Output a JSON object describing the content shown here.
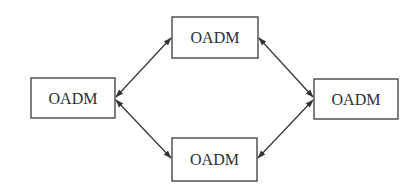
{
  "diagram": {
    "type": "ring-network",
    "nodes": [
      {
        "id": "top",
        "label": "OADM",
        "x": 172,
        "y": 17,
        "w": 86,
        "h": 41
      },
      {
        "id": "left",
        "label": "OADM",
        "x": 31,
        "y": 78,
        "w": 84,
        "h": 40
      },
      {
        "id": "right",
        "label": "OADM",
        "x": 314,
        "y": 79,
        "w": 84,
        "h": 40
      },
      {
        "id": "bottom",
        "label": "OADM",
        "x": 172,
        "y": 138,
        "w": 85,
        "h": 43
      }
    ],
    "edges": [
      {
        "from": "left",
        "to": "top",
        "bidirectional": true
      },
      {
        "from": "top",
        "to": "right",
        "bidirectional": true
      },
      {
        "from": "left",
        "to": "bottom",
        "bidirectional": true
      },
      {
        "from": "bottom",
        "to": "right",
        "bidirectional": true
      }
    ]
  }
}
